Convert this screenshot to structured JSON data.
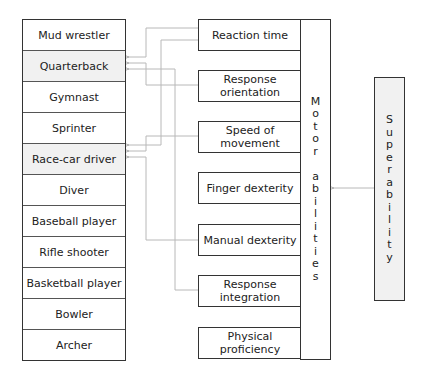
{
  "diagram": {
    "occupations": [
      {
        "label": "Mud wrestler",
        "highlighted": false
      },
      {
        "label": "Quarterback",
        "highlighted": true
      },
      {
        "label": "Gymnast",
        "highlighted": false
      },
      {
        "label": "Sprinter",
        "highlighted": false
      },
      {
        "label": "Race-car driver",
        "highlighted": true
      },
      {
        "label": "Diver",
        "highlighted": false
      },
      {
        "label": "Baseball player",
        "highlighted": false
      },
      {
        "label": "Rifle shooter",
        "highlighted": false
      },
      {
        "label": "Basketball player",
        "highlighted": false
      },
      {
        "label": "Bowler",
        "highlighted": false
      },
      {
        "label": "Archer",
        "highlighted": false
      }
    ],
    "abilities": [
      {
        "line1": "Reaction time",
        "line2": ""
      },
      {
        "line1": "Response",
        "line2": "orientation"
      },
      {
        "line1": "Speed of",
        "line2": "movement"
      },
      {
        "line1": "Finger dexterity",
        "line2": ""
      },
      {
        "line1": "Manual dexterity",
        "line2": ""
      },
      {
        "line1": "Response",
        "line2": "integration"
      },
      {
        "line1": "Physical",
        "line2": "proficiency"
      }
    ],
    "motor_abilities_label": [
      "M",
      "o",
      "t",
      "o",
      "r",
      " ",
      "a",
      "b",
      "i",
      "l",
      "i",
      "t",
      "i",
      "e",
      "s"
    ],
    "superability_label": [
      "S",
      "u",
      "p",
      "e",
      "r",
      "a",
      "b",
      "i",
      "l",
      "i",
      "t",
      "y"
    ],
    "connections": [
      {
        "from": "Reaction time",
        "to": "Quarterback"
      },
      {
        "from": "Reaction time",
        "to": "Race-car driver"
      },
      {
        "from": "Response orientation",
        "to": "Quarterback"
      },
      {
        "from": "Response integration",
        "to": "Quarterback"
      },
      {
        "from": "Speed of movement",
        "to": "Race-car driver"
      },
      {
        "from": "Manual dexterity",
        "to": "Race-car driver"
      },
      {
        "from": "Superability",
        "to": "Motor abilities"
      }
    ],
    "colors": {
      "box_border": "#333333",
      "highlight_fill": "#f1f1f1",
      "connector": "#b5b5b5"
    }
  }
}
